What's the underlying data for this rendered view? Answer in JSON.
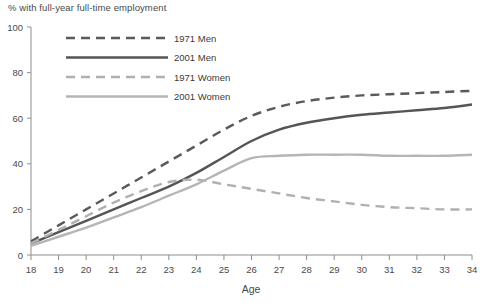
{
  "chart_data": {
    "type": "line",
    "title": "% with full-year full-time employment",
    "xlabel": "Age",
    "ylabel": "",
    "xlim": [
      18,
      34
    ],
    "ylim": [
      0,
      100
    ],
    "grid": false,
    "legend_position": "top-left-inside",
    "x": [
      18,
      19,
      20,
      21,
      22,
      23,
      24,
      25,
      26,
      27,
      28,
      29,
      30,
      31,
      32,
      33,
      34
    ],
    "xticks": [
      "18",
      "19",
      "20",
      "21",
      "22",
      "23",
      "24",
      "25",
      "26",
      "27",
      "28",
      "29",
      "30",
      "31",
      "32",
      "33",
      "34"
    ],
    "yticks": [
      "0",
      "20",
      "40",
      "60",
      "80",
      "100"
    ],
    "ytick_values": [
      0,
      20,
      40,
      60,
      80,
      100
    ],
    "series": [
      {
        "name": "1971 Men",
        "style": "dashed",
        "color": "#5a5a5a",
        "values": [
          6,
          13,
          20,
          27,
          34,
          41,
          48,
          55,
          61,
          65,
          67.5,
          69,
          70,
          70.5,
          71,
          71.5,
          72
        ]
      },
      {
        "name": "2001 Men",
        "style": "solid",
        "color": "#555555",
        "values": [
          5,
          10,
          15,
          20,
          25,
          30,
          36,
          43,
          50,
          55,
          58,
          60,
          61.5,
          62.5,
          63.5,
          64.5,
          66
        ]
      },
      {
        "name": "1971 Women",
        "style": "dashed",
        "color": "#b0b0b0",
        "values": [
          5,
          11,
          17,
          23,
          28,
          32,
          33,
          31,
          29,
          27,
          25,
          23.5,
          22,
          21,
          20.5,
          20,
          20
        ]
      },
      {
        "name": "2001 Women",
        "style": "solid",
        "color": "#b5b5b5",
        "values": [
          4,
          8,
          12,
          16.5,
          21,
          26,
          31,
          37,
          42.5,
          43.5,
          44,
          44,
          44,
          43.5,
          43.5,
          43.5,
          44
        ]
      }
    ]
  },
  "legend": {
    "entries": [
      {
        "label": "1971 Men"
      },
      {
        "label": "2001 Men"
      },
      {
        "label": "1971 Women"
      },
      {
        "label": "2001 Women"
      }
    ]
  }
}
